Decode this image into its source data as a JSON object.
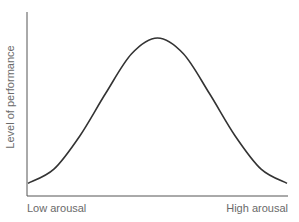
{
  "chart_data": {
    "type": "line",
    "title": "",
    "xlabel": "",
    "ylabel": "Level of performance",
    "x_tick_labels": [
      "Low arousal",
      "High arousal"
    ],
    "x": [
      0,
      0.1,
      0.2,
      0.3,
      0.4,
      0.5,
      0.6,
      0.7,
      0.8,
      0.9,
      1.0
    ],
    "series": [
      {
        "name": "Performance",
        "values": [
          0.08,
          0.17,
          0.38,
          0.65,
          0.9,
          1.0,
          0.9,
          0.65,
          0.38,
          0.17,
          0.08
        ]
      }
    ],
    "xlim": [
      0,
      1
    ],
    "ylim": [
      0,
      1.1
    ],
    "grid": false,
    "legend": null,
    "line_color": "#333333",
    "axis_color": "#555555"
  },
  "labels": {
    "y_axis": "Level of performance",
    "x_low": "Low arousal",
    "x_high": "High arousal"
  }
}
